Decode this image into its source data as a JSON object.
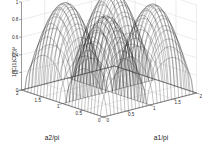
{
  "figure": {
    "background_color": "#ffffff",
    "type": "matlab-mesh-surface-3d"
  },
  "axes": {
    "x": {
      "title": "a1/pi",
      "ticks": [
        "0",
        "0.5",
        "1",
        "1.5",
        "2"
      ],
      "range": [
        0,
        2
      ]
    },
    "y": {
      "title": "a2/pi",
      "ticks": [
        "0",
        "0.5",
        "1",
        "1.5",
        "2"
      ],
      "range": [
        0,
        2
      ]
    },
    "z": {
      "title": "1/|C(1)C(2)|²",
      "ticks": [
        "0",
        "0.2",
        "0.4",
        "0.6",
        "0.8",
        "1"
      ],
      "range": [
        0,
        1
      ]
    }
  },
  "chart_data": {
    "type": "surface",
    "title": "",
    "xlabel": "a1/pi",
    "ylabel": "a2/pi",
    "zlabel": "1/|C(1)C(2)|²",
    "xlim": [
      0,
      2
    ],
    "ylim": [
      0,
      2
    ],
    "zlim": [
      0,
      1
    ],
    "grid": true,
    "legend": null,
    "colormap": "gray-wireframe",
    "mesh_color": "#171717",
    "grid_color": "#c9c9c9",
    "x": [
      0,
      0.125,
      0.25,
      0.375,
      0.5,
      0.625,
      0.75,
      0.875,
      1,
      1.125,
      1.25,
      1.375,
      1.5,
      1.625,
      1.75,
      1.875,
      2
    ],
    "y": [
      0,
      0.125,
      0.25,
      0.375,
      0.5,
      0.625,
      0.75,
      0.875,
      1,
      1.125,
      1.25,
      1.375,
      1.5,
      1.625,
      1.75,
      1.875,
      2
    ],
    "z_formula": "sin(pi*a1/pi)^2 * sin(pi*a2/pi)^2 style product of periodic lobes; zeros at multiples of 1, peaks near 0.5 and 1.5",
    "z_description": "Surface has four deep narrow funnels dropping to 0 at the lattice points (a1/pi, a2/pi) in {0,1,2} x {0,1,2}; four broad rounded ridges/plateaus peaking near value 1 centred at half-integer coordinates (0.5,0.5), (0.5,1.5), (1.5,0.5), (1.5,1.5).",
    "z_peaks": [
      {
        "x": 0.5,
        "y": 0.5,
        "z": 1.0
      },
      {
        "x": 0.5,
        "y": 1.5,
        "z": 1.0
      },
      {
        "x": 1.5,
        "y": 0.5,
        "z": 1.0
      },
      {
        "x": 1.5,
        "y": 1.5,
        "z": 1.0
      }
    ],
    "z_minima": [
      {
        "x": 0.0,
        "y": 0.0,
        "z": 0.0
      },
      {
        "x": 1.0,
        "y": 0.0,
        "z": 0.0
      },
      {
        "x": 2.0,
        "y": 0.0,
        "z": 0.0
      },
      {
        "x": 0.0,
        "y": 1.0,
        "z": 0.0
      },
      {
        "x": 1.0,
        "y": 1.0,
        "z": 0.0
      },
      {
        "x": 2.0,
        "y": 1.0,
        "z": 0.0
      },
      {
        "x": 0.0,
        "y": 2.0,
        "z": 0.0
      },
      {
        "x": 1.0,
        "y": 2.0,
        "z": 0.0
      },
      {
        "x": 2.0,
        "y": 2.0,
        "z": 0.0
      }
    ],
    "view": {
      "azimuth": -37.5,
      "elevation": 30
    }
  }
}
